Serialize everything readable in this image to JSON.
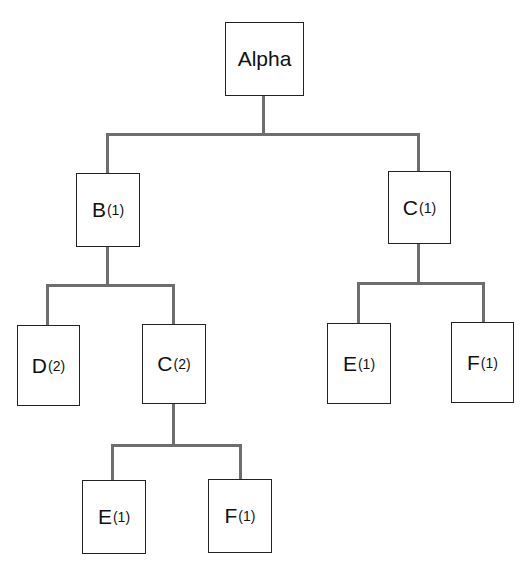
{
  "diagram": {
    "type": "tree",
    "line_color": "#6e6e6e",
    "nodes": {
      "root": {
        "label": "Alpha",
        "sub": ""
      },
      "b1": {
        "label": "B",
        "sub": "(1)"
      },
      "c1": {
        "label": "C",
        "sub": "(1)"
      },
      "d2": {
        "label": "D",
        "sub": "(2)"
      },
      "c2": {
        "label": "C",
        "sub": "(2)"
      },
      "e1_right": {
        "label": "E",
        "sub": "(1)"
      },
      "f1_right": {
        "label": "F",
        "sub": "(1)"
      },
      "e1_bottom": {
        "label": "E",
        "sub": "(1)"
      },
      "f1_bottom": {
        "label": "F",
        "sub": "(1)"
      }
    },
    "edges": [
      [
        "Alpha",
        "B(1)"
      ],
      [
        "Alpha",
        "C(1)"
      ],
      [
        "B(1)",
        "D(2)"
      ],
      [
        "B(1)",
        "C(2)"
      ],
      [
        "C(1)",
        "E(1)"
      ],
      [
        "C(1)",
        "F(1)"
      ],
      [
        "C(2)",
        "E(1)"
      ],
      [
        "C(2)",
        "F(1)"
      ]
    ]
  }
}
